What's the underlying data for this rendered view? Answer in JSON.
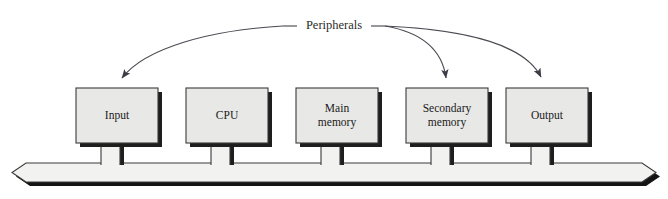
{
  "figure": {
    "background_color": "#ffffff"
  },
  "annotation": {
    "label": "Peripherals",
    "label_x": 334,
    "label_y": 26,
    "leader_left_x": 283,
    "leader_right_x": 385
  },
  "style": {
    "box_fill": "#e8e8e6",
    "box_stroke": "#3a3a3a",
    "box_shadow": "#1e1e1e",
    "bus_fill": "#f2f2f0",
    "bus_stroke": "#3a3a3a",
    "bus_shadow": "#141414",
    "arrow_color": "#4a4a52",
    "stem_fill": "#f2f2f0"
  },
  "bus": {
    "name": "system-bus",
    "left": 12,
    "right": 656,
    "top": 163,
    "bottom": 182,
    "chamfer": 14,
    "shadow_offset": 4
  },
  "boxes": [
    {
      "id": "input",
      "label": "Input",
      "lines": [
        "Input"
      ],
      "x": 76,
      "y": 88,
      "width": 82,
      "height": 55,
      "stem_x": 101,
      "stem_width": 19
    },
    {
      "id": "cpu",
      "label": "CPU",
      "lines": [
        "CPU"
      ],
      "x": 186,
      "y": 88,
      "width": 82,
      "height": 55,
      "stem_x": 211,
      "stem_width": 19
    },
    {
      "id": "main-memory",
      "label": "Main memory",
      "lines": [
        "Main",
        "memory"
      ],
      "x": 296,
      "y": 88,
      "width": 82,
      "height": 55,
      "stem_x": 321,
      "stem_width": 19
    },
    {
      "id": "secondary-memory",
      "label": "Secondary memory",
      "lines": [
        "Secondary",
        "memory"
      ],
      "x": 406,
      "y": 88,
      "width": 82,
      "height": 55,
      "stem_x": 431,
      "stem_width": 19
    },
    {
      "id": "output",
      "label": "Output",
      "lines": [
        "Output"
      ],
      "x": 506,
      "y": 88,
      "width": 82,
      "height": 55,
      "stem_x": 531,
      "stem_width": 19
    }
  ],
  "arrows": [
    {
      "id": "arrow-to-input",
      "target": "input",
      "path": "M 283 26 C 210 30 145 48 122 78",
      "tip_x": 119,
      "tip_y": 84,
      "tip_angle": 128
    },
    {
      "id": "arrow-to-secondary-memory",
      "target": "secondary-memory",
      "path": "M 385 26 C 420 32 442 48 446 78",
      "tip_x": 447,
      "tip_y": 85,
      "tip_angle": 83
    },
    {
      "id": "arrow-to-output",
      "target": "output",
      "path": "M 385 26 C 470 30 525 45 541 77",
      "tip_x": 544,
      "tip_y": 84,
      "tip_angle": 63
    }
  ]
}
